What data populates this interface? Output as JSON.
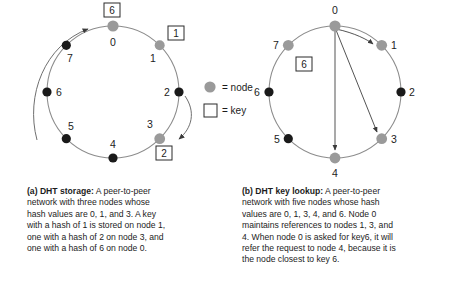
{
  "figure": {
    "colors": {
      "member_node": "#9a9a9a",
      "nonmember_node": "#1a1a1a",
      "ring": "#8c8c8c",
      "arrow": "#3a3a3a",
      "key_box_border": "#2b2b2b",
      "text": "#1c1c1c"
    },
    "legend": {
      "node_symbol": "node-dot",
      "node_text": "= node",
      "key_symbol": "key-square",
      "key_text": "= key"
    },
    "panel_a": {
      "id": "a",
      "ring_nodes": [
        {
          "label": "0",
          "angle_deg": 0,
          "member": true
        },
        {
          "label": "1",
          "angle_deg": 45,
          "member": true
        },
        {
          "label": "2",
          "angle_deg": 90,
          "member": false
        },
        {
          "label": "3",
          "angle_deg": 135,
          "member": true
        },
        {
          "label": "4",
          "angle_deg": 180,
          "member": false
        },
        {
          "label": "5",
          "angle_deg": 225,
          "member": false
        },
        {
          "label": "6",
          "angle_deg": 270,
          "member": false
        },
        {
          "label": "7",
          "angle_deg": 315,
          "member": false
        }
      ],
      "keys": [
        {
          "label": "6",
          "at_node": "0"
        },
        {
          "label": "1",
          "at_node": "1"
        },
        {
          "label": "2",
          "at_node": "3"
        }
      ],
      "arrows": [
        {
          "name": "key-6-to-node-0",
          "from": "key 6 outside node 6 position",
          "to": "node 0"
        },
        {
          "name": "key-2-to-node-3",
          "from": "node 2 position",
          "to": "node 3"
        }
      ],
      "caption": {
        "title": "(a) DHT storage:",
        "lines": [
          " A peer-to-peer",
          "network with three nodes whose",
          "hash values are 0, 1, and 3. A key",
          "with a hash of 1 is stored on node 1,",
          "one with a hash of 2 on node 3, and",
          "one with a hash of 6 on node 0."
        ]
      }
    },
    "panel_b": {
      "id": "b",
      "ring_nodes": [
        {
          "label": "0",
          "angle_deg": 0,
          "member": true
        },
        {
          "label": "1",
          "angle_deg": 45,
          "member": true
        },
        {
          "label": "2",
          "angle_deg": 90,
          "member": false
        },
        {
          "label": "3",
          "angle_deg": 135,
          "member": true
        },
        {
          "label": "4",
          "angle_deg": 180,
          "member": true
        },
        {
          "label": "5",
          "angle_deg": 225,
          "member": false
        },
        {
          "label": "6",
          "angle_deg": 270,
          "member": false
        },
        {
          "label": "7",
          "angle_deg": 315,
          "member": true
        }
      ],
      "keys": [
        {
          "label": "6",
          "at_node": "7"
        }
      ],
      "arrows": [
        {
          "name": "reference-0-to-1",
          "from": "node 0",
          "to": "node 1"
        },
        {
          "name": "reference-0-to-3",
          "from": "node 0",
          "to": "node 3"
        },
        {
          "name": "reference-0-to-4",
          "from": "node 0",
          "to": "node 4"
        }
      ],
      "caption": {
        "title": "(b) DHT key lookup:",
        "lines": [
          " A peer-to-peer",
          "network with five nodes whose hash",
          "values are 0, 1, 3, 4, and 6. Node 0",
          "maintains references to nodes 1, 3, and",
          "4. When node 0 is asked for key6, it will",
          "refer the request to node 4, because it is",
          "the node closest to key 6."
        ]
      }
    }
  }
}
